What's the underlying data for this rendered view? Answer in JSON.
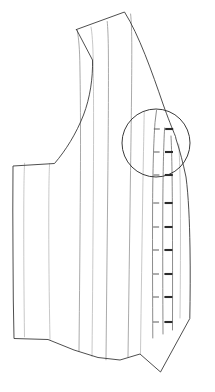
{
  "illustration": {
    "title": "Corset front panel pattern line drawing",
    "subject": "corset-bodice-front-panel",
    "style": "technical-line-drawing",
    "background_color": "#ffffff",
    "canvas": {
      "width": 215,
      "height": 392
    },
    "colors": {
      "outline": "#3a3a3a",
      "seam_line": "#8d8d8d",
      "seam_line_faint": "#b0b0b0",
      "busk_line": "#6e6e6e",
      "detail_circle": "#2f2f2f",
      "stud_mark": "#2b2b2b",
      "loop_mark": "#6a6a6a"
    },
    "outline": {
      "name": "garment-outline",
      "path": "M 76.5 29.5 L 124.5 12.0 C 139 35 152 72 163 104 C 168 118 172 128 175.5 136.5 L 176 139 C 180 151 183 163 186 177 C 188.5 196 189.5 220 190 248 C 190.4 272 190.2 296 189.8 318.5 L 160.5 372.0 L 140.0 354.0 L 120.0 360.0 L 98.0 357.5 L 74.0 350.0 L 48.0 339.5 L 14.0 338.5 L 13.3 300.0 L 13.0 255.0 L 12.8 210.0 L 13.0 166.0 L 54.5 163.5 C 66 150 76 134 83.5 115 C 90 98 93 78 92.5 60 L 76.5 29.5 Z"
    },
    "top_edge_note": "upper edge rises left-to-right to a peak at the center-front top",
    "bottom_edge_note": "lower edge dips to a V point at the center-front bottom",
    "armhole_note": "concave armhole curve on the left (side-back) edge",
    "seam_lines": [
      {
        "name": "seam-line-1",
        "path": "M 24.5 336.8 C 24.0 300 23.6 250 23.8 205 C 23.9 182 24.2 170 24.6 163.2",
        "weight": "faint"
      },
      {
        "name": "seam-line-2",
        "path": "M 50.0 339.3 C 49.2 300 48.6 250 48.8 205 C 48.9 182 49.2 170 49.6 163.4",
        "weight": "faint"
      },
      {
        "name": "seam-line-3",
        "path": "M 79.0 351.5 C 79.5 300 80.0 240 80.4 180 C 80.7 130 80.4 90 79.8 60.5 C 79.4 45 78.2 34 77.0 30.0",
        "weight": "normal"
      },
      {
        "name": "seam-line-4",
        "path": "M 92.0 356.5 C 92.6 300 93.0 240 93.4 180 C 93.7 130 93.6 90 93.2 60.8 C 93.0 44 92.0 32 91.0 27.0",
        "weight": "faint"
      },
      {
        "name": "seam-line-5",
        "path": "M 106.0 359.8 C 106.6 300 107.2 240 107.8 180 C 108.3 130 108.6 86 108.4 55.0 C 108.3 38 107.8 27 107.2 21.5",
        "weight": "normal"
      },
      {
        "name": "seam-line-6",
        "path": "M 128.0 357.0 C 128.8 300 129.6 240 130.4 180 C 131.2 128 131.8 82 131.8 48.0 C 131.8 32 131.3 20 130.6 14.0",
        "weight": "normal"
      },
      {
        "name": "seam-line-7",
        "path": "M 140.5 353.5 C 141.2 300 142.0 245 142.8 190 C 143.5 150 144.0 126 144.2 112.0",
        "weight": "faint"
      },
      {
        "name": "seam-line-8",
        "path": "M 180.0 318.0 C 180.4 280 180.6 240 180.4 205 C 180.2 178 179.6 158 178.8 144.0",
        "weight": "faint"
      }
    ],
    "busk": {
      "name": "center-front-busk",
      "left_edge_path": "M 152.8 338.0 C 152.6 300 152.4 250 152.6 205 C 152.8 170 153.6 142 155.0 122.5 L 156.5 110.5",
      "right_edge_path": "M 172.5 330.0 C 172.6 292 172.6 250 172.4 210 C 172.2 176 171.8 152 171.0 136.0",
      "center_path": "M 163.0 334.0 C 162.8 296 162.6 250 162.8 208 C 163.0 172 163.6 146 164.6 128.0"
    },
    "fastener_rows": {
      "name": "busk-stud-rows",
      "count": 9,
      "description": "paired busk loop and stud marks down the center front",
      "y_positions": [
        129,
        152,
        175,
        203,
        227,
        250,
        274,
        297,
        322
      ],
      "loop_x": [
        153.5,
        159.5
      ],
      "stud_x": [
        165.0,
        173.0
      ]
    },
    "detail_callout": {
      "name": "magnifier-detail-circle",
      "shape": "circle",
      "center_x": 156,
      "center_y": 143,
      "radius": 34,
      "description": "circular detail callout highlighting the busk fastening area"
    }
  }
}
